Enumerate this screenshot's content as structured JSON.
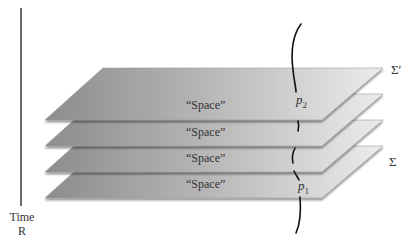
{
  "diagram": {
    "time_axis": {
      "label_line1": "Time",
      "label_line2": "R"
    },
    "slices": [
      {
        "name": "Σ′",
        "space_label": "“Space”",
        "index": 0,
        "point_label": "p2",
        "point_sub": "2"
      },
      {
        "name": "",
        "space_label": "“Space”",
        "index": 1
      },
      {
        "name": "Σ",
        "space_label": "“Space”",
        "index": 2
      },
      {
        "name": "",
        "space_label": "“Space”",
        "index": 3,
        "point_label": "p1",
        "point_sub": "1"
      }
    ],
    "labels": {
      "sigma_prime": "Σ′",
      "sigma": "Σ",
      "p2_main": "p",
      "p2_sub": "2",
      "p1_main": "p",
      "p1_sub": "1",
      "space_1": "“Space”",
      "space_2": "“Space”",
      "space_3": "“Space”",
      "space_4": "“Space”"
    },
    "colors": {
      "plane_dark": "#8a8a8a",
      "plane_light": "#e6e6e6",
      "curve": "#111111",
      "axis": "#333333"
    }
  }
}
